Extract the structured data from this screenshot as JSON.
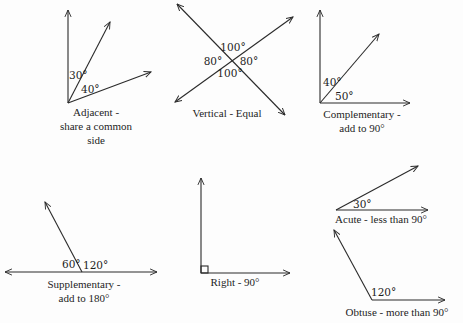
{
  "diagram": {
    "type": "angle-relationships",
    "panels": [
      {
        "id": "adjacent",
        "angles": [
          "30°",
          "40°"
        ],
        "caption": [
          "Adjacent -",
          "share a common",
          "side"
        ]
      },
      {
        "id": "vertical",
        "angles": [
          "100°",
          "80°",
          "80°",
          "100°"
        ],
        "caption": [
          "Vertical - Equal"
        ]
      },
      {
        "id": "complementary",
        "angles": [
          "40°",
          "50°"
        ],
        "caption": [
          "Complementary -",
          "add to 90°"
        ]
      },
      {
        "id": "supplementary",
        "angles": [
          "60°",
          "120°"
        ],
        "caption": [
          "Supplementary -",
          "add to 180°"
        ]
      },
      {
        "id": "right",
        "angles": [],
        "caption": [
          "Right - 90°"
        ]
      },
      {
        "id": "acute",
        "angles": [
          "30°"
        ],
        "caption": [
          "Acute - less than 90°"
        ]
      },
      {
        "id": "obtuse",
        "angles": [
          "120°"
        ],
        "caption": [
          "Obtuse - more than 90°"
        ]
      }
    ],
    "colors": {
      "line": "#2a2a2a",
      "text": "#1e1e1e",
      "background": "#fdfdfd"
    }
  }
}
